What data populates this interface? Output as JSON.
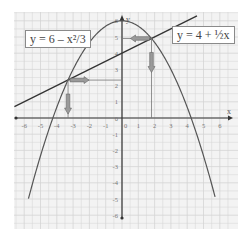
{
  "chart_data": {
    "type": "line",
    "title": "",
    "xlabel": "x",
    "ylabel": "y",
    "xlim": [
      -6,
      6
    ],
    "ylim": [
      -6,
      6
    ],
    "grid": true,
    "x_ticks": [
      "-6",
      "-5",
      "-4",
      "-3",
      "-2",
      "-1",
      "0",
      "1",
      "2",
      "3",
      "4",
      "5",
      "6"
    ],
    "y_ticks": [
      "6",
      "5",
      "4",
      "3",
      "2",
      "1",
      "0",
      "-1",
      "-2",
      "-3",
      "-4",
      "-5",
      "-6"
    ],
    "series": [
      {
        "name": "y = 6 – x²/3",
        "kind": "parabola",
        "x": [
          -5.74,
          -5,
          -4,
          -3,
          -2,
          -1,
          0,
          1,
          2,
          3,
          4,
          5,
          5.74
        ],
        "values": [
          -5,
          -2.33,
          0.67,
          3,
          4.67,
          5.67,
          6,
          5.67,
          4.67,
          3,
          0.67,
          -2.33,
          -5
        ],
        "color": "#555555"
      },
      {
        "name": "y = 4 + ½x",
        "kind": "line",
        "x": [
          -6.6,
          4.6
        ],
        "values": [
          0.7,
          6.3
        ],
        "color": "#333333"
      }
    ],
    "annotations": [
      {
        "type": "intersection",
        "x": -3.31,
        "y": 2.34,
        "arrows": [
          "right-to-y-axis",
          "down-to-x-axis"
        ]
      },
      {
        "type": "intersection",
        "x": 1.81,
        "y": 4.91,
        "arrows": [
          "left-to-y-axis",
          "down-to-x-axis"
        ]
      }
    ],
    "legend": [
      {
        "label": "y = 6 – x²/3",
        "position": "top-left"
      },
      {
        "label": "y = 4 + ½x",
        "position": "top-right"
      }
    ]
  },
  "labels": {
    "parabola_eq": "y = 6 – x²/3",
    "line_eq": "y = 4 + ½x",
    "x_axis": "x",
    "y_axis": "y"
  },
  "colors": {
    "grid": "#d4d4d4",
    "paper": "#f3f3f3",
    "axis": "#333333",
    "curve": "#555555",
    "arrow_fill": "#9a9a9a"
  }
}
